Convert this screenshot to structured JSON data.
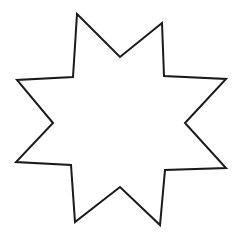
{
  "figure": {
    "shape": "eight-point-star",
    "point_count": 8,
    "fill_color": "#ffffff",
    "stroke_color": "#1a1a1a",
    "background_color": "#ffffff"
  }
}
